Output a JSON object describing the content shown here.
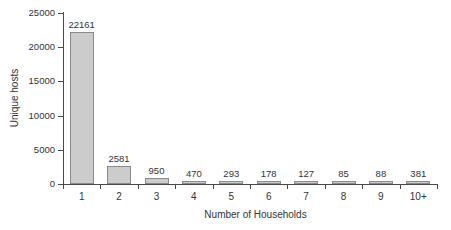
{
  "chart_data": {
    "type": "bar",
    "title": "",
    "xlabel": "Number of Households",
    "ylabel": "Unique hosts",
    "categories": [
      "1",
      "2",
      "3",
      "4",
      "5",
      "6",
      "7",
      "8",
      "9",
      "10+"
    ],
    "values": [
      22161,
      2581,
      950,
      470,
      293,
      178,
      127,
      85,
      88,
      381
    ],
    "value_labels": [
      "22161",
      "2581",
      "950",
      "470",
      "293",
      "178",
      "127",
      "85",
      "88",
      "381"
    ],
    "ylim": [
      0,
      25000
    ],
    "ytick_values": [
      0,
      5000,
      10000,
      15000,
      20000,
      25000
    ],
    "ytick_labels": [
      "0",
      "5000",
      "10000",
      "15000",
      "20000",
      "25000"
    ],
    "grid": false,
    "legend": null,
    "bar_color": "#cccccc",
    "bar_border_color": "#8a8a8a",
    "axis_color": "#4a4a4a",
    "text_color": "#333333",
    "background": "#ffffff"
  }
}
